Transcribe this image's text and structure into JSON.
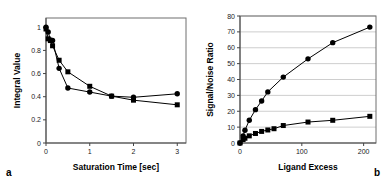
{
  "figure": {
    "background": "#ffffff",
    "panels": [
      {
        "label": "a"
      },
      {
        "label": "b"
      }
    ]
  },
  "chart_data": [
    {
      "type": "line",
      "panel": "a",
      "title": "",
      "xlabel": "Saturation Time [sec]",
      "ylabel": "Integral Value",
      "xlim": [
        0,
        3.2
      ],
      "ylim": [
        0,
        1.08
      ],
      "xticks": [
        0,
        1,
        2,
        3
      ],
      "xticklabels": [
        "0",
        "1",
        "2",
        "3"
      ],
      "yticks": [
        0,
        0.2,
        0.4,
        0.6,
        0.8,
        1
      ],
      "yticklabels": [
        "0",
        "0.2",
        "0.4",
        "0.6",
        "0.8",
        "1"
      ],
      "grid": false,
      "frame": "box",
      "legend": "none",
      "series": [
        {
          "name": "circles",
          "marker": "circle",
          "color": "#000000",
          "points": [
            [
              0.0,
              1.0
            ],
            [
              0.05,
              0.96
            ],
            [
              0.1,
              0.89
            ],
            [
              0.15,
              0.885
            ],
            [
              0.3,
              0.645
            ],
            [
              0.5,
              0.475
            ],
            [
              1.0,
              0.44
            ],
            [
              1.5,
              0.405
            ],
            [
              2.0,
              0.395
            ],
            [
              3.0,
              0.425
            ]
          ]
        },
        {
          "name": "squares",
          "marker": "square",
          "color": "#000000",
          "points": [
            [
              0.0,
              0.985
            ],
            [
              0.05,
              0.9
            ],
            [
              0.1,
              0.885
            ],
            [
              0.15,
              0.84
            ],
            [
              0.3,
              0.715
            ],
            [
              0.5,
              0.615
            ],
            [
              1.0,
              0.49
            ],
            [
              1.5,
              0.405
            ],
            [
              2.0,
              0.37
            ],
            [
              3.0,
              0.33
            ]
          ]
        }
      ]
    },
    {
      "type": "line",
      "panel": "b",
      "title": "",
      "xlabel": "Ligand Excess",
      "ylabel": "Signal/Noise Ratio",
      "xlim": [
        0,
        220
      ],
      "ylim": [
        0,
        80
      ],
      "xticks": [
        0,
        100,
        200
      ],
      "xticklabels": [
        "0",
        "100",
        "200"
      ],
      "yticks": [
        0,
        10,
        20,
        30,
        40,
        50,
        60,
        70,
        80
      ],
      "yticklabels": [
        "0",
        "10",
        "20",
        "30",
        "40",
        "50",
        "60",
        "70",
        "80"
      ],
      "grid": true,
      "frame": "box",
      "legend": "none",
      "series": [
        {
          "name": "circles",
          "marker": "circle",
          "color": "#000000",
          "points": [
            [
              0,
              0
            ],
            [
              5,
              4.5
            ],
            [
              8,
              8.0
            ],
            [
              15,
              14.3
            ],
            [
              25,
              21.0
            ],
            [
              35,
              26.5
            ],
            [
              45,
              32.2
            ],
            [
              70,
              41.5
            ],
            [
              110,
              53.0
            ],
            [
              150,
              63.2
            ],
            [
              210,
              73.0
            ]
          ]
        },
        {
          "name": "squares",
          "marker": "square",
          "color": "#000000",
          "points": [
            [
              0,
              0
            ],
            [
              5,
              2.2
            ],
            [
              8,
              3.0
            ],
            [
              15,
              4.5
            ],
            [
              25,
              6.0
            ],
            [
              35,
              7.3
            ],
            [
              45,
              8.2
            ],
            [
              55,
              9.0
            ],
            [
              70,
              11.0
            ],
            [
              110,
              13.2
            ],
            [
              150,
              14.3
            ],
            [
              210,
              16.8
            ]
          ]
        }
      ]
    }
  ]
}
